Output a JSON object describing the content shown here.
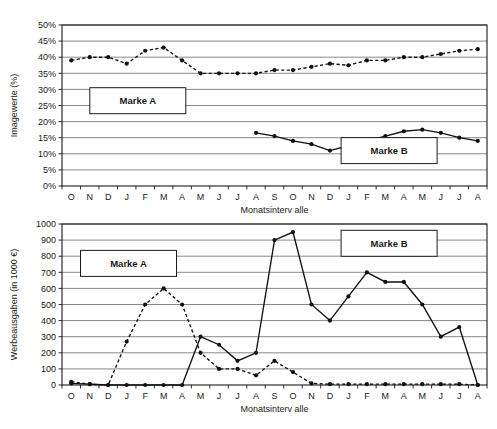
{
  "figure": {
    "background": "#ffffff",
    "ink": "#111111",
    "gridline_color": "#7a7a7a"
  },
  "chart_data": [
    {
      "id": "top",
      "type": "line",
      "title": "",
      "xlabel": "Monatsinterv alle",
      "ylabel": "Imagewerte (%)",
      "ylim": [
        0,
        50
      ],
      "ytick_step": 5,
      "ytick_labels": [
        "0%",
        "5%",
        "10%",
        "15%",
        "20%",
        "25%",
        "30%",
        "35%",
        "40%",
        "45%",
        "50%"
      ],
      "grid": true,
      "legend": "inline-box",
      "categories": [
        "O",
        "N",
        "D",
        "J",
        "F",
        "M",
        "A",
        "M",
        "J",
        "J",
        "A",
        "S",
        "O",
        "N",
        "D",
        "J",
        "F",
        "M",
        "A",
        "M",
        "J",
        "J",
        "A"
      ],
      "series": [
        {
          "name": "Marke A",
          "style": "dashed",
          "marker": "filled-circle",
          "label_box": {
            "text": "Marke A",
            "x_index": 3.6,
            "y_value": 26.5
          },
          "values": [
            39,
            40,
            40,
            38,
            42,
            43,
            39,
            35,
            35,
            35,
            35,
            36,
            36,
            37,
            38,
            37.5,
            39,
            39,
            40,
            40,
            41,
            42,
            42.5
          ]
        },
        {
          "name": "Marke B",
          "style": "solid",
          "marker": "filled-circle",
          "label_box": {
            "text": "Marke B",
            "x_index": 17.2,
            "y_value": 11
          },
          "values": [
            null,
            null,
            null,
            null,
            null,
            null,
            null,
            null,
            null,
            null,
            16.5,
            15.5,
            14,
            13,
            11,
            12.5,
            14,
            15.5,
            17,
            17.5,
            16.5,
            15,
            14
          ]
        }
      ]
    },
    {
      "id": "bottom",
      "type": "line",
      "title": "",
      "xlabel": "Monatsinterv alle",
      "ylabel": "Werbeausgaben (in 1000 €)",
      "ylim": [
        0,
        1000
      ],
      "ytick_step": 100,
      "ytick_labels": [
        "0",
        "100",
        "200",
        "300",
        "400",
        "500",
        "600",
        "700",
        "800",
        "900",
        "1000"
      ],
      "grid": true,
      "legend": "inline-box",
      "categories": [
        "O",
        "N",
        "D",
        "J",
        "F",
        "M",
        "A",
        "M",
        "J",
        "J",
        "A",
        "S",
        "O",
        "N",
        "D",
        "J",
        "F",
        "M",
        "A",
        "M",
        "J",
        "J",
        "A"
      ],
      "series": [
        {
          "name": "Marke A",
          "style": "dashed",
          "marker": "filled-circle",
          "label_box": {
            "text": "Marke A",
            "x_index": 3.1,
            "y_value": 755
          },
          "values": [
            20,
            5,
            0,
            270,
            500,
            600,
            500,
            200,
            100,
            100,
            60,
            150,
            80,
            10,
            5,
            5,
            5,
            5,
            5,
            5,
            5,
            5,
            0
          ]
        },
        {
          "name": "Marke B",
          "style": "solid",
          "marker": "filled-circle",
          "label_box": {
            "text": "Marke B",
            "x_index": 17.2,
            "y_value": 880
          },
          "values": [
            10,
            5,
            0,
            0,
            0,
            0,
            0,
            300,
            250,
            150,
            200,
            900,
            950,
            500,
            400,
            550,
            700,
            640,
            640,
            500,
            300,
            360,
            0
          ]
        }
      ]
    }
  ]
}
